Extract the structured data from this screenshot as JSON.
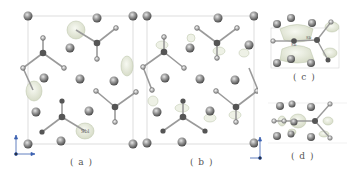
{
  "figure": {
    "panels": [
      {
        "id": "a",
        "label": "( a )",
        "atom_label": "Sbl"
      },
      {
        "id": "b",
        "label": "( b )"
      },
      {
        "id": "c",
        "label": "( c )",
        "atom_labels": [
          "Sb",
          "Sb"
        ]
      },
      {
        "id": "d",
        "label": "( d )"
      }
    ],
    "axes": {
      "a_label": "a",
      "c_label": "c",
      "x_label": "x"
    },
    "colors": {
      "cell_line": "#c8c8c8",
      "atom_large": "#8a8a8a",
      "atom_dark": "#555555",
      "bond": "#9a9a9a",
      "isosurface": "#e4e9d8",
      "isosurface_edge": "#b8c2a6"
    }
  }
}
